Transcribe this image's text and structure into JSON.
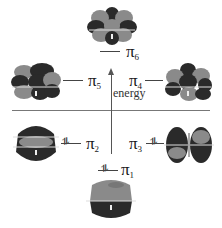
{
  "diagram": {
    "title": "",
    "axis_label": "energy",
    "orbitals": [
      {
        "id": "pi6",
        "symbol": "π",
        "index": "6",
        "electrons": 0,
        "occupied": false
      },
      {
        "id": "pi5",
        "symbol": "π",
        "index": "5",
        "electrons": 0,
        "occupied": false
      },
      {
        "id": "pi4",
        "symbol": "π",
        "index": "4",
        "electrons": 0,
        "occupied": false
      },
      {
        "id": "pi2",
        "symbol": "π",
        "index": "2",
        "electrons": 2,
        "occupied": true,
        "pair_mark": "⥮"
      },
      {
        "id": "pi3",
        "symbol": "π",
        "index": "3",
        "electrons": 2,
        "occupied": true,
        "pair_mark": "⥮"
      },
      {
        "id": "pi1",
        "symbol": "π",
        "index": "1",
        "electrons": 2,
        "occupied": true,
        "pair_mark": "⥮"
      }
    ],
    "colors": {
      "lobe_light": "#8a8a8a",
      "lobe_dark": "#2a2a2a",
      "line": "#444444"
    }
  }
}
